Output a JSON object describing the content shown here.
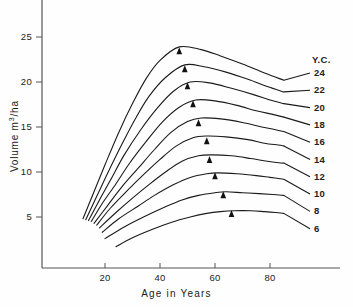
{
  "chart_data": {
    "type": "line",
    "title": "",
    "xlabel": "Age  in  Years",
    "ylabel": "Volume  m³/ha",
    "xlim": [
      0,
      90
    ],
    "ylim": [
      0,
      27
    ],
    "grid": false,
    "legend_position": "right",
    "legend_title": "Y.C.",
    "xticks": [
      20,
      40,
      60,
      80
    ],
    "yticks": [
      5,
      10,
      15,
      20,
      25
    ],
    "marker_note": "filled triangle marks point of maximum mean annual increment on each curve",
    "series": [
      {
        "name": "24",
        "label": "24",
        "peak_age": 47,
        "peak_volume": 23.9,
        "marker_age": 47,
        "marker_volume": 23.2,
        "x": [
          12,
          16,
          20,
          25,
          30,
          35,
          40,
          47,
          55,
          62,
          70,
          78,
          85
        ],
        "y": [
          4.8,
          7.8,
          10.8,
          14.4,
          17.6,
          20.4,
          22.4,
          23.9,
          23.6,
          22.9,
          22.0,
          21.0,
          20.2
        ]
      },
      {
        "name": "22",
        "label": "22",
        "peak_age": 49,
        "peak_volume": 21.9,
        "marker_age": 49,
        "marker_volume": 21.2,
        "x": [
          13,
          17,
          21,
          26,
          31,
          36,
          42,
          49,
          56,
          64,
          72,
          79,
          85
        ],
        "y": [
          4.7,
          7.3,
          9.9,
          13.0,
          15.9,
          18.4,
          20.5,
          21.9,
          21.7,
          21.1,
          20.3,
          19.5,
          18.9
        ]
      },
      {
        "name": "20",
        "label": "20",
        "peak_age": 51,
        "peak_volume": 20.0,
        "marker_age": 50,
        "marker_volume": 19.3,
        "x": [
          14,
          18,
          22,
          27,
          33,
          39,
          45,
          51,
          58,
          66,
          74,
          80,
          85
        ],
        "y": [
          4.6,
          6.9,
          9.1,
          11.9,
          14.7,
          17.1,
          19.0,
          20.0,
          19.9,
          19.3,
          18.6,
          18.0,
          17.6
        ]
      },
      {
        "name": "18",
        "label": "18",
        "peak_age": 53,
        "peak_volume": 18.0,
        "marker_age": 52,
        "marker_volume": 17.3,
        "x": [
          15,
          19,
          24,
          29,
          35,
          41,
          47,
          53,
          60,
          68,
          75,
          81,
          85
        ],
        "y": [
          4.5,
          6.5,
          8.7,
          11.0,
          13.4,
          15.6,
          17.2,
          18.0,
          17.9,
          17.4,
          16.8,
          16.4,
          16.1
        ]
      },
      {
        "name": "16",
        "label": "16",
        "peak_age": 55,
        "peak_volume": 16.0,
        "marker_age": 54,
        "marker_volume": 15.2,
        "x": [
          16,
          21,
          26,
          32,
          38,
          44,
          50,
          55,
          62,
          70,
          77,
          82,
          85
        ],
        "y": [
          4.3,
          6.3,
          8.3,
          10.4,
          12.5,
          14.4,
          15.6,
          16.0,
          15.9,
          15.5,
          15.0,
          14.7,
          14.5
        ]
      },
      {
        "name": "14",
        "label": "14",
        "peak_age": 57,
        "peak_volume": 14.0,
        "marker_age": 57,
        "marker_volume": 13.2,
        "x": [
          17,
          22,
          28,
          34,
          40,
          46,
          52,
          57,
          64,
          72,
          78,
          83,
          85
        ],
        "y": [
          4.1,
          6.0,
          7.9,
          9.7,
          11.4,
          12.9,
          13.8,
          14.0,
          13.9,
          13.6,
          13.2,
          13.0,
          12.9
        ]
      },
      {
        "name": "12",
        "label": "12",
        "peak_age": 59,
        "peak_volume": 11.9,
        "marker_age": 58,
        "marker_volume": 11.1,
        "x": [
          18,
          24,
          30,
          36,
          42,
          48,
          54,
          59,
          66,
          73,
          79,
          84,
          85
        ],
        "y": [
          3.8,
          5.5,
          7.1,
          8.6,
          10.0,
          11.2,
          11.8,
          11.9,
          11.8,
          11.5,
          11.2,
          11.0,
          11.0
        ]
      },
      {
        "name": "10",
        "label": "10",
        "peak_age": 61,
        "peak_volume": 9.9,
        "marker_age": 60,
        "marker_volume": 9.3,
        "x": [
          19,
          25,
          32,
          38,
          45,
          51,
          57,
          61,
          68,
          75,
          80,
          85
        ],
        "y": [
          3.3,
          4.8,
          6.2,
          7.4,
          8.6,
          9.4,
          9.8,
          9.9,
          9.8,
          9.6,
          9.4,
          9.2
        ]
      },
      {
        "name": "8",
        "label": "8",
        "peak_age": 64,
        "peak_volume": 7.8,
        "marker_age": 63,
        "marker_volume": 7.2,
        "x": [
          20,
          27,
          34,
          41,
          48,
          54,
          60,
          64,
          70,
          76,
          81,
          85
        ],
        "y": [
          2.6,
          3.9,
          5.0,
          6.0,
          6.9,
          7.4,
          7.7,
          7.8,
          7.7,
          7.6,
          7.5,
          7.4
        ]
      },
      {
        "name": "6",
        "label": "6",
        "peak_age": 67,
        "peak_volume": 5.7,
        "marker_age": 66,
        "marker_volume": 5.1,
        "x": [
          24,
          30,
          37,
          44,
          51,
          57,
          62,
          67,
          73,
          78,
          82,
          85
        ],
        "y": [
          1.7,
          2.7,
          3.6,
          4.4,
          5.0,
          5.4,
          5.6,
          5.7,
          5.7,
          5.6,
          5.5,
          5.4
        ]
      }
    ]
  },
  "axes": {
    "x_tick_labels": [
      "20",
      "40",
      "60",
      "80"
    ],
    "y_tick_labels": [
      "25",
      "20",
      "15",
      "10",
      "5"
    ],
    "x_title": "Age  in  Years",
    "y_title_main": "Volume  m",
    "y_title_sup": "3",
    "y_title_tail": "/ha"
  },
  "legend": {
    "header": "Y.C.",
    "entries": [
      "24",
      "22",
      "20",
      "18",
      "16",
      "14",
      "12",
      "10",
      "8",
      "6"
    ]
  },
  "style": {
    "line_color": "#1a1a1a",
    "axis_color": "#555555",
    "background": "#fefefe",
    "marker_color": "#111111"
  }
}
